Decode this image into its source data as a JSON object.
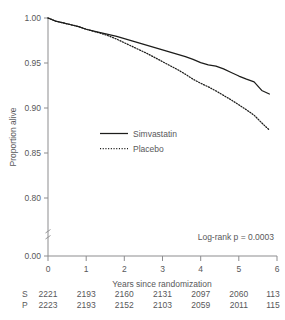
{
  "chart_data": {
    "type": "line",
    "title": "",
    "xlabel": "Years since randomization",
    "ylabel": "Proportion alive",
    "xlim": [
      0,
      6
    ],
    "ylim": [
      0.78,
      1.0
    ],
    "grid": false,
    "legend_position": "center-left",
    "x_ticks": [
      "0",
      "1",
      "2",
      "3",
      "4",
      "5",
      "6"
    ],
    "y_ticks": [
      "0.00",
      "0.80",
      "0.85",
      "0.90",
      "0.95",
      "1.00"
    ],
    "y_axis_break": true,
    "annotation": "Log-rank p = 0.0003",
    "series": [
      {
        "name": "Simvastatin",
        "style": "solid",
        "x": [
          0.0,
          0.2,
          0.4,
          0.6,
          0.8,
          1.0,
          1.2,
          1.4,
          1.6,
          1.8,
          2.0,
          2.2,
          2.4,
          2.6,
          2.8,
          3.0,
          3.2,
          3.4,
          3.6,
          3.8,
          4.0,
          4.2,
          4.4,
          4.6,
          4.8,
          5.0,
          5.2,
          5.4,
          5.6,
          5.8
        ],
        "y": [
          1.0,
          0.9965,
          0.9945,
          0.9925,
          0.9905,
          0.9875,
          0.9855,
          0.9835,
          0.9815,
          0.9795,
          0.977,
          0.9745,
          0.972,
          0.9695,
          0.967,
          0.9645,
          0.962,
          0.9595,
          0.957,
          0.954,
          0.9505,
          0.948,
          0.9465,
          0.9435,
          0.9395,
          0.9355,
          0.932,
          0.929,
          0.9195,
          0.9155
        ]
      },
      {
        "name": "Placebo",
        "style": "dotted",
        "x": [
          0.0,
          0.2,
          0.4,
          0.6,
          0.8,
          1.0,
          1.2,
          1.4,
          1.6,
          1.8,
          2.0,
          2.2,
          2.4,
          2.6,
          2.8,
          3.0,
          3.2,
          3.4,
          3.6,
          3.8,
          4.0,
          4.2,
          4.4,
          4.6,
          4.8,
          5.0,
          5.2,
          5.4,
          5.6,
          5.8
        ],
        "y": [
          1.0,
          0.9965,
          0.9945,
          0.9925,
          0.9905,
          0.9875,
          0.9852,
          0.9828,
          0.98,
          0.9765,
          0.9725,
          0.9685,
          0.9645,
          0.9605,
          0.956,
          0.9515,
          0.947,
          0.9425,
          0.9375,
          0.932,
          0.9275,
          0.9235,
          0.919,
          0.914,
          0.909,
          0.9035,
          0.898,
          0.892,
          0.8835,
          0.8755
        ]
      }
    ]
  },
  "legend": {
    "items": [
      {
        "label": "Simvastatin",
        "style": "solid"
      },
      {
        "label": "Placebo",
        "style": "dotted"
      }
    ]
  },
  "risk_table": {
    "rows": [
      {
        "label": "S",
        "values": [
          "2221",
          "2193",
          "2160",
          "2131",
          "2097",
          "2060",
          "113"
        ]
      },
      {
        "label": "P",
        "values": [
          "2223",
          "2193",
          "2152",
          "2103",
          "2059",
          "2011",
          "115"
        ]
      }
    ]
  },
  "colors": {
    "curve": "#1d1d1b",
    "axis": "#8d8d8f",
    "text": "#58585a",
    "background": "#ffffff"
  }
}
